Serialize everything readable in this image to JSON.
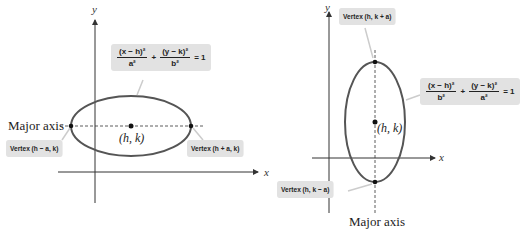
{
  "left_diagram": {
    "axis_labels": {
      "x": "x",
      "y": "y"
    },
    "major_axis_label": "Major axis",
    "center_label": "(h, k)",
    "equation": {
      "term1_num": "(x − h)²",
      "term1_den": "a²",
      "plus": "+",
      "term2_num": "(y − k)²",
      "term2_den": "b²",
      "rhs": "= 1"
    },
    "vertex_left": "Vertex (h − a, k)",
    "vertex_right": "Vertex (h + a, k)",
    "orientation": "horizontal"
  },
  "right_diagram": {
    "axis_labels": {
      "x": "x",
      "y": "y"
    },
    "major_axis_label": "Major axis",
    "center_label": "(h, k)",
    "equation": {
      "term1_num": "(x − h)²",
      "term1_den": "b²",
      "plus": "+",
      "term2_num": "(y − k)²",
      "term2_den": "a²",
      "rhs": "= 1"
    },
    "vertex_top": "Vertex (h, k + a)",
    "vertex_bottom": "Vertex (h, k − a)",
    "orientation": "vertical"
  },
  "colors": {
    "ellipse": "#555555",
    "axes": "#333333",
    "callout_bg": "#e2e2e2",
    "point": "#111111"
  }
}
